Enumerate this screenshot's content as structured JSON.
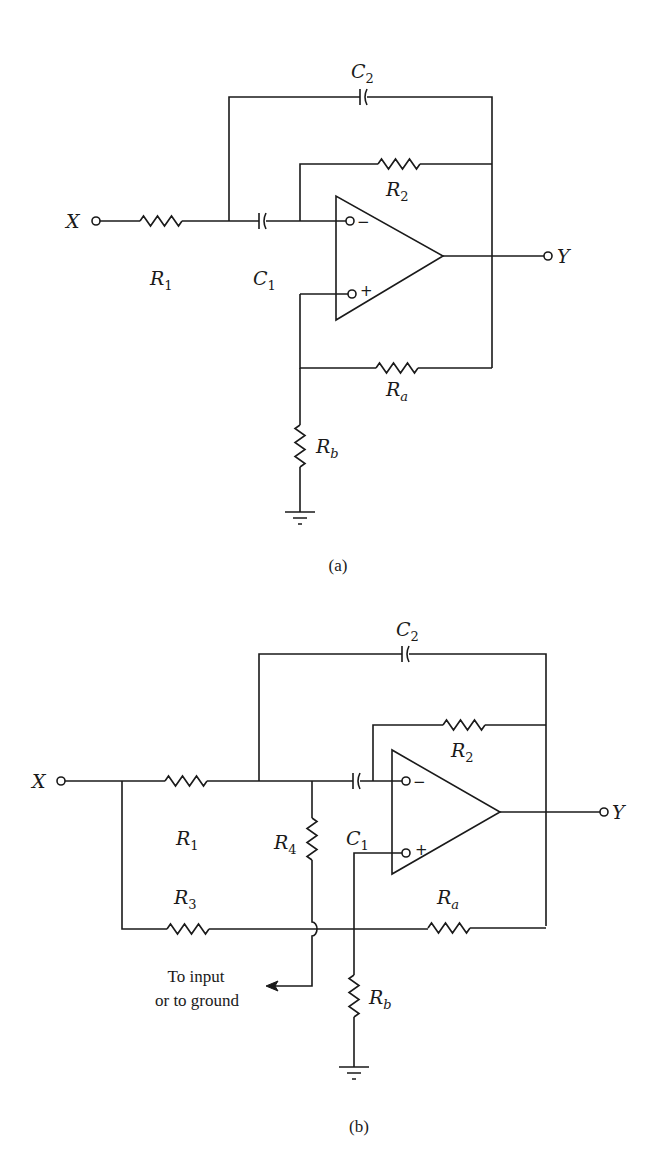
{
  "figure": {
    "subfigures": [
      {
        "caption": "(a)",
        "input_label": "X",
        "output_label": "Y",
        "components": {
          "R1": {
            "letter": "R",
            "sub": "1"
          },
          "C1": {
            "letter": "C",
            "sub": "1"
          },
          "C2": {
            "letter": "C",
            "sub": "2"
          },
          "R2": {
            "letter": "R",
            "sub": "2"
          },
          "Ra": {
            "letter": "R",
            "sub": "a"
          },
          "Rb": {
            "letter": "R",
            "sub": "b"
          }
        },
        "opamp": {
          "inverting": "−",
          "noninverting": "+"
        }
      },
      {
        "caption": "(b)",
        "input_label": "X",
        "output_label": "Y",
        "components": {
          "R1": {
            "letter": "R",
            "sub": "1"
          },
          "R3": {
            "letter": "R",
            "sub": "3"
          },
          "R4": {
            "letter": "R",
            "sub": "4"
          },
          "C1": {
            "letter": "C",
            "sub": "1"
          },
          "C2": {
            "letter": "C",
            "sub": "2"
          },
          "R2": {
            "letter": "R",
            "sub": "2"
          },
          "Ra": {
            "letter": "R",
            "sub": "a"
          },
          "Rb": {
            "letter": "R",
            "sub": "b"
          }
        },
        "opamp": {
          "inverting": "−",
          "noninverting": "+"
        },
        "note_line1": "To input",
        "note_line2": "or to ground"
      }
    ]
  }
}
